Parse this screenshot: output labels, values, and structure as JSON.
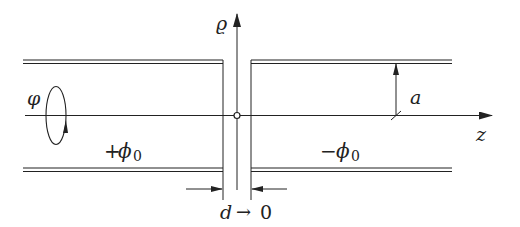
{
  "diagram": {
    "type": "two semi-infinite coaxial cylinders separated by a gap",
    "labels": {
      "rho_axis": "ϱ",
      "z_axis": "z",
      "phi_rotation": "φ",
      "left_potential_sign": "+",
      "left_potential": "ϕ",
      "left_potential_sub": "0",
      "right_potential_sign": "−",
      "right_potential": "ϕ",
      "right_potential_sub": "0",
      "radius": "a",
      "gap": "d",
      "gap_arrow": "→",
      "gap_limit": "0"
    },
    "colors": {
      "line": "#222222",
      "background": "#ffffff"
    }
  }
}
